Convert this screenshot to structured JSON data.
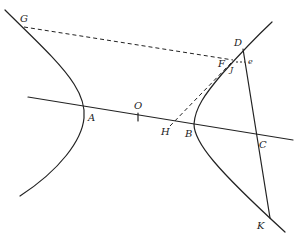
{
  "diagram": {
    "type": "hyperbola-construction",
    "colors": {
      "stroke": "#222222",
      "background": "#ffffff"
    },
    "points": {
      "G": {
        "label": "G",
        "x": 24,
        "y": 27
      },
      "D": {
        "label": "D",
        "x": 243,
        "y": 49
      },
      "F": {
        "label": "F",
        "x": 231,
        "y": 61
      },
      "J": {
        "label": "J",
        "x": 235,
        "y": 63
      },
      "e": {
        "label": "e",
        "x": 248,
        "y": 62
      },
      "O": {
        "label": "O",
        "x": 138,
        "y": 117
      },
      "A": {
        "label": "A",
        "x": 84,
        "y": 110
      },
      "H": {
        "label": "H",
        "x": 170,
        "y": 126
      },
      "B": {
        "label": "B",
        "x": 194,
        "y": 125
      },
      "C": {
        "label": "C",
        "x": 257,
        "y": 134
      },
      "K": {
        "label": "K",
        "x": 270,
        "y": 218
      }
    },
    "labels": {
      "G": "G",
      "D": "D",
      "F": "F",
      "J": "J",
      "e": "e",
      "O": "O",
      "A": "A",
      "H": "H",
      "B": "B",
      "C": "C",
      "K": "K"
    },
    "elements": [
      "left hyperbola branch through G and vertex A",
      "right hyperbola branch through D, F, vertex B and K",
      "transverse axis line through A, O, H, B, C",
      "solid line D–K crossing axis at C",
      "dashed line G–F",
      "dashed line H–F",
      "short dashed segment J–e"
    ]
  }
}
